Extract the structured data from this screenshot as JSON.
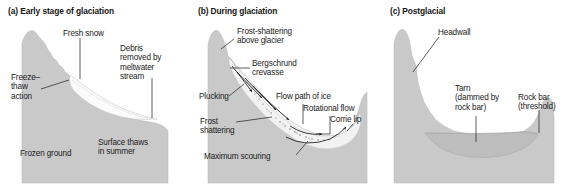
{
  "figure": {
    "colors": {
      "ground": "#c9c9c9",
      "ground_edge": "#b4b4b4",
      "snow": "#fbfbfb",
      "ice": "#efefef",
      "ice_edge": "#bdbdbd",
      "tarn": "#c0c0c0",
      "tarn_edge": "#aeaeae",
      "ink": "#1b1b1b",
      "background": "#ffffff"
    }
  },
  "panels": [
    {
      "id": "a",
      "title": "(a) Early stage of glaciation",
      "labels": [
        {
          "name": "fresh-snow",
          "text": "Fresh snow"
        },
        {
          "name": "debris-removed",
          "text": "Debris\nremoved by\nmeltwater\nstream"
        },
        {
          "name": "freeze-thaw",
          "text": "Freeze–\nthaw\naction"
        },
        {
          "name": "frozen-ground",
          "text": "Frozen ground"
        },
        {
          "name": "surface-thaws",
          "text": "Surface thaws\nin summer"
        }
      ]
    },
    {
      "id": "b",
      "title": "(b) During glaciation",
      "labels": [
        {
          "name": "frost-shattering-above-glacier",
          "text": "Frost-shattering\nabove glacier"
        },
        {
          "name": "bergschrund-crevasse",
          "text": "Bergschrund\ncrevasse"
        },
        {
          "name": "plucking",
          "text": "Plucking"
        },
        {
          "name": "flow-path-of-ice",
          "text": "Flow path of ice"
        },
        {
          "name": "rotational-flow",
          "text": "Rotational flow"
        },
        {
          "name": "corrie-lip",
          "text": "Corrie lip"
        },
        {
          "name": "frost-shattering",
          "text": "Frost\nshattering"
        },
        {
          "name": "maximum-scouring",
          "text": "Maximum scouring"
        }
      ]
    },
    {
      "id": "c",
      "title": "(c) Postglacial",
      "labels": [
        {
          "name": "headwall",
          "text": "Headwall"
        },
        {
          "name": "tarn",
          "text": "Tarn\n(dammed by\nrock bar)"
        },
        {
          "name": "rock-bar",
          "text": "Rock bar\n(threshold)"
        }
      ]
    }
  ]
}
